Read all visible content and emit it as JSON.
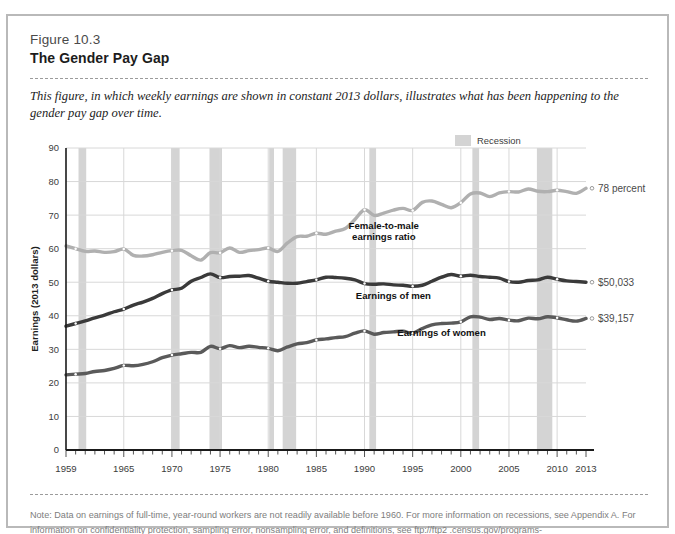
{
  "figure": {
    "number": "Figure 10.3",
    "title": "The Gender Pay Gap",
    "caption": "This figure, in which weekly earnings are shown in constant 2013 dollars, illustrates what has been happening to the gender pay gap over time.",
    "note": "Note: Data on earnings of full-time, year-round workers are not readily available before 1960. For more information on recessions, see Appendix A. For information on confidentiality protection, sampling error, nonsampling error, and definitions, see ftp://ftp2 .census.gov/programs-surveys/cps/techdocs/cpsmar14.pdf."
  },
  "legend": {
    "recession_label": "Recession",
    "recession_color": "#d4d4d4"
  },
  "colors": {
    "ratio_line": "#b0b0b0",
    "men_line": "#3a3a3a",
    "women_line": "#5a5a5a",
    "grid": "#d8d8d8",
    "axis": "#1a1a1a",
    "card_border": "#b9b9b9"
  },
  "chart_data": {
    "type": "line",
    "title": "The Gender Pay Gap",
    "xlabel": "",
    "ylabel": "Earnings (2013 dollars)",
    "xlim": [
      1959,
      2013
    ],
    "ylim": [
      0,
      90
    ],
    "ytick_step": 10,
    "grid": true,
    "legend_position": "top-right",
    "x_ticks_labeled": [
      1959,
      1965,
      1970,
      1975,
      1980,
      1985,
      1990,
      1995,
      2000,
      2005,
      2010,
      2013
    ],
    "y_ticks": [
      0,
      10,
      20,
      30,
      40,
      50,
      60,
      70,
      80,
      90
    ],
    "note_units": "Earnings series in thousands of 2013 dollars; ratio series in percent",
    "annotations": [
      {
        "name": "ratio-series-label",
        "text": "Female-to-male\nearnings ratio",
        "x": 1992,
        "y": 66
      },
      {
        "name": "men-series-label",
        "text": "Earnings of men",
        "x": 1993,
        "y": 45
      },
      {
        "name": "women-series-label",
        "text": "Earnings of women",
        "x": 1998,
        "y": 34
      }
    ],
    "end_labels": [
      {
        "name": "ratio-end-label",
        "text": "78 percent",
        "value": 78
      },
      {
        "name": "men-end-label",
        "text": "$50,033",
        "value": 50.033
      },
      {
        "name": "women-end-label",
        "text": "$39,157",
        "value": 39.157
      }
    ],
    "recessions": [
      {
        "start": 1960.3,
        "end": 1961.1
      },
      {
        "start": 1969.9,
        "end": 1970.8
      },
      {
        "start": 1973.9,
        "end": 1975.2
      },
      {
        "start": 1980.1,
        "end": 1980.6
      },
      {
        "start": 1981.5,
        "end": 1982.9
      },
      {
        "start": 1990.5,
        "end": 1991.2
      },
      {
        "start": 2001.2,
        "end": 2001.9
      },
      {
        "start": 2007.9,
        "end": 2009.5
      }
    ],
    "x": [
      1959,
      1960,
      1961,
      1962,
      1963,
      1964,
      1965,
      1966,
      1967,
      1968,
      1969,
      1970,
      1971,
      1972,
      1973,
      1974,
      1975,
      1976,
      1977,
      1978,
      1979,
      1980,
      1981,
      1982,
      1983,
      1984,
      1985,
      1986,
      1987,
      1988,
      1989,
      1990,
      1991,
      1992,
      1993,
      1994,
      1995,
      1996,
      1997,
      1998,
      1999,
      2000,
      2001,
      2002,
      2003,
      2004,
      2005,
      2006,
      2007,
      2008,
      2009,
      2010,
      2011,
      2012,
      2013
    ],
    "series": [
      {
        "name": "Female-to-male earnings ratio",
        "units": "percent",
        "color": "#b0b0b0",
        "values": [
          60.8,
          60.0,
          59.2,
          59.3,
          58.9,
          59.1,
          59.9,
          58.0,
          57.8,
          58.2,
          58.9,
          59.4,
          59.5,
          57.9,
          56.6,
          58.8,
          58.8,
          60.2,
          58.9,
          59.4,
          59.7,
          60.2,
          59.2,
          61.7,
          63.6,
          63.7,
          64.6,
          64.3,
          65.2,
          66.0,
          68.7,
          71.6,
          69.9,
          70.6,
          71.5,
          72.0,
          71.4,
          73.8,
          74.2,
          73.2,
          72.2,
          73.7,
          76.3,
          76.6,
          75.5,
          76.6,
          77.0,
          76.9,
          77.8,
          77.1,
          77.0,
          77.4,
          77.0,
          76.5,
          78.0
        ]
      },
      {
        "name": "Earnings of men",
        "units": "thousands of 2013 dollars",
        "color": "#3a3a3a",
        "values": [
          36.9,
          37.7,
          38.5,
          39.4,
          40.2,
          41.2,
          42.0,
          43.2,
          44.1,
          45.2,
          46.6,
          47.7,
          48.2,
          50.3,
          51.4,
          52.5,
          51.4,
          51.7,
          51.8,
          52.0,
          51.2,
          50.3,
          50.0,
          49.7,
          49.7,
          50.2,
          50.7,
          51.5,
          51.4,
          51.2,
          50.7,
          49.6,
          49.4,
          49.5,
          49.2,
          49.1,
          48.8,
          49.1,
          50.3,
          51.5,
          52.3,
          51.8,
          52.1,
          51.7,
          51.5,
          51.2,
          50.2,
          50.0,
          50.5,
          50.7,
          51.5,
          50.9,
          50.4,
          50.2,
          50.0
        ]
      },
      {
        "name": "Earnings of women",
        "units": "thousands of 2013 dollars",
        "color": "#5a5a5a",
        "values": [
          22.4,
          22.6,
          22.8,
          23.4,
          23.7,
          24.3,
          25.2,
          25.1,
          25.5,
          26.3,
          27.5,
          28.3,
          28.7,
          29.1,
          29.1,
          30.9,
          30.2,
          31.1,
          30.5,
          30.9,
          30.6,
          30.3,
          29.6,
          30.7,
          31.6,
          32.0,
          32.8,
          33.1,
          33.5,
          33.8,
          34.8,
          35.5,
          34.5,
          35.0,
          35.2,
          35.4,
          34.8,
          36.2,
          37.3,
          37.7,
          37.8,
          38.2,
          39.7,
          39.6,
          38.9,
          39.2,
          38.7,
          38.5,
          39.3,
          39.1,
          39.7,
          39.4,
          38.8,
          38.4,
          39.2
        ]
      }
    ]
  }
}
